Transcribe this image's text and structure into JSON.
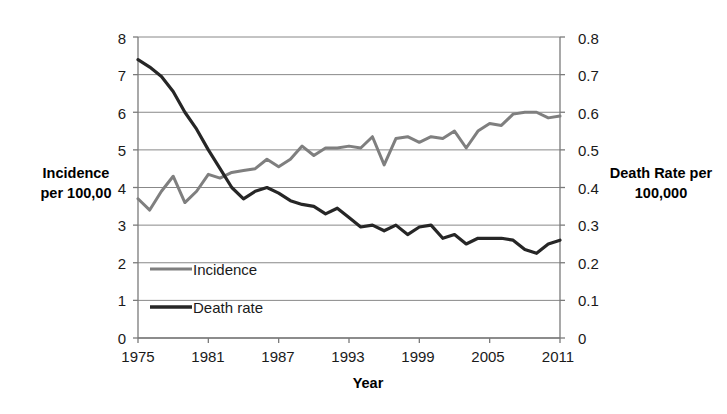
{
  "chart_data": {
    "type": "line",
    "title": "",
    "xlabel": "Year",
    "ylabel": "Incidence per 100,00",
    "y2label": "Death Rate per 100,000",
    "grid": true,
    "legend_position": "inside-lower-left",
    "xlim": [
      1975,
      2011
    ],
    "ylim": [
      0,
      8
    ],
    "y2lim": [
      0,
      0.8
    ],
    "x_ticks": [
      "1975",
      "1981",
      "1987",
      "1993",
      "1999",
      "2005",
      "2011"
    ],
    "y_left_ticks": [
      "0",
      "1",
      "2",
      "3",
      "4",
      "5",
      "6",
      "7",
      "8"
    ],
    "y_right_ticks": [
      "0",
      "0.1",
      "0.2",
      "0.3",
      "0.4",
      "0.5",
      "0.6",
      "0.7",
      "0.8"
    ],
    "x": [
      1975,
      1976,
      1977,
      1978,
      1979,
      1980,
      1981,
      1982,
      1983,
      1984,
      1985,
      1986,
      1987,
      1988,
      1989,
      1990,
      1991,
      1992,
      1993,
      1994,
      1995,
      1996,
      1997,
      1998,
      1999,
      2000,
      2001,
      2002,
      2003,
      2004,
      2005,
      2006,
      2007,
      2008,
      2009,
      2010,
      2011
    ],
    "series": [
      {
        "name": "Incidence",
        "axis": "left",
        "color": "#7f7f7f",
        "values": [
          3.7,
          3.4,
          3.9,
          4.3,
          3.6,
          3.9,
          4.35,
          4.25,
          4.4,
          4.45,
          4.5,
          4.75,
          4.55,
          4.75,
          5.1,
          4.85,
          5.05,
          5.05,
          5.1,
          5.05,
          5.35,
          4.6,
          5.3,
          5.35,
          5.2,
          5.35,
          5.3,
          5.5,
          5.05,
          5.5,
          5.7,
          5.65,
          5.95,
          6.0,
          6.0,
          5.85,
          5.9
        ]
      },
      {
        "name": "Death rate",
        "axis": "right",
        "color": "#262626",
        "values": [
          0.74,
          0.72,
          0.695,
          0.655,
          0.6,
          0.555,
          0.5,
          0.45,
          0.4,
          0.37,
          0.39,
          0.4,
          0.385,
          0.365,
          0.355,
          0.35,
          0.33,
          0.345,
          0.32,
          0.295,
          0.3,
          0.285,
          0.3,
          0.275,
          0.295,
          0.3,
          0.265,
          0.275,
          0.25,
          0.265,
          0.265,
          0.265,
          0.26,
          0.235,
          0.225,
          0.25,
          0.26
        ]
      }
    ],
    "legend": [
      {
        "label": "Incidence",
        "color": "#7f7f7f"
      },
      {
        "label": "Death rate",
        "color": "#262626"
      }
    ]
  },
  "axes": {
    "x_title": "Year",
    "y_left_title_line1": "Incidence",
    "y_left_title_line2": "per 100,00",
    "y_right_title_line1": "Death Rate per",
    "y_right_title_line2": "100,000"
  }
}
